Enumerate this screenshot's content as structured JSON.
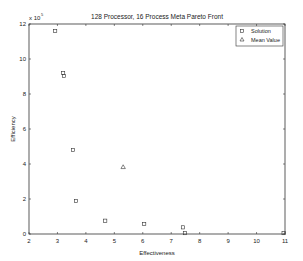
{
  "chart_data": {
    "type": "scatter",
    "title": "128 Processor, 16 Process Meta Pareto Front",
    "xlabel": "Effectiveness",
    "ylabel": "Efficiency",
    "y_multiplier": "x 10",
    "y_exponent": "5",
    "xlim": [
      2,
      11
    ],
    "ylim": [
      0,
      12
    ],
    "xticks": [
      2,
      3,
      4,
      5,
      6,
      7,
      8,
      9,
      10,
      11
    ],
    "yticks": [
      0,
      2,
      4,
      6,
      8,
      10,
      12
    ],
    "grid": false,
    "legend_position": "upper right",
    "series": [
      {
        "name": "Solution",
        "marker": "square",
        "points": [
          [
            2.92,
            11.6
          ],
          [
            3.2,
            9.2
          ],
          [
            3.23,
            9.03
          ],
          [
            3.55,
            4.8
          ],
          [
            3.65,
            1.89
          ],
          [
            4.68,
            0.76
          ],
          [
            6.05,
            0.57
          ],
          [
            7.41,
            0.38
          ],
          [
            7.48,
            0.05
          ],
          [
            10.95,
            0.05
          ]
        ]
      },
      {
        "name": "Mean Value",
        "marker": "triangle",
        "points": [
          [
            5.31,
            3.83
          ]
        ]
      }
    ]
  },
  "legend": {
    "items": [
      {
        "label": "Solution",
        "marker": "square"
      },
      {
        "label": "Mean Value",
        "marker": "triangle"
      }
    ]
  },
  "colors": {
    "axis": "#333333",
    "marker": "#333333",
    "background": "#ffffff"
  }
}
